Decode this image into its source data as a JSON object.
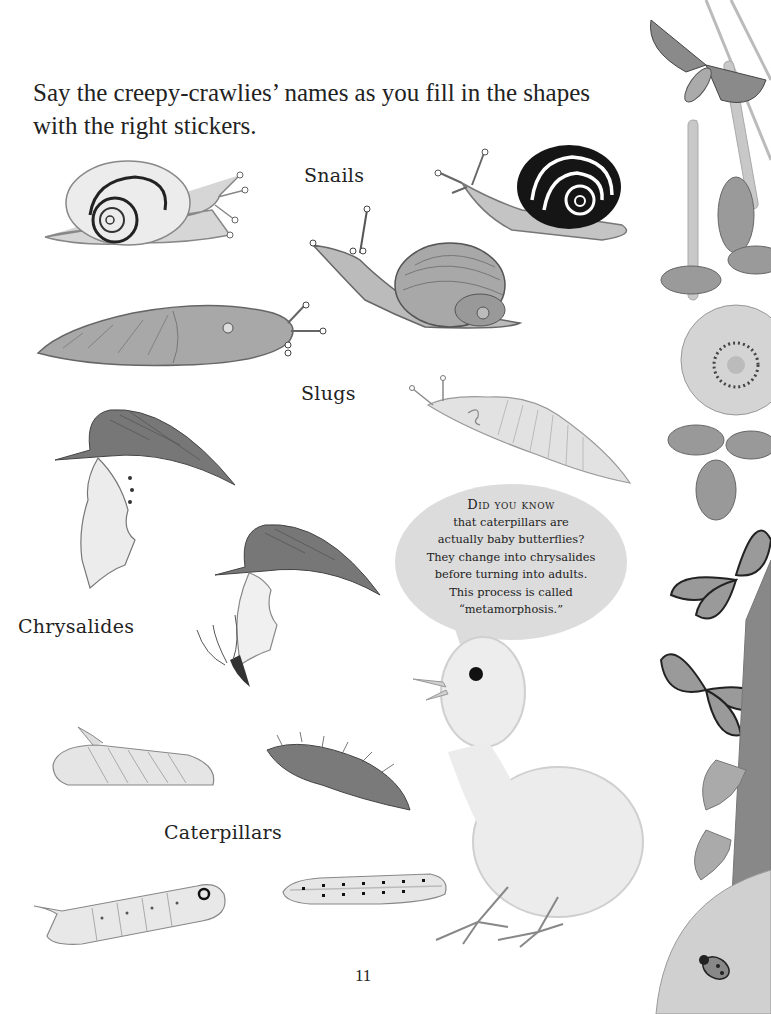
{
  "page": {
    "instructions": "Say the creepy-crawlies’ names as you fill in the shapes with the right stickers.",
    "page_number": "11"
  },
  "sections": [
    {
      "label": "Snails",
      "items": [
        "white-lipped-snail",
        "banded-snail",
        "garden-snail"
      ]
    },
    {
      "label": "Slugs",
      "items": [
        "leopard-slug",
        "pale-slug"
      ]
    },
    {
      "label": "Chrysalides",
      "items": [
        "chrysalis-hanging",
        "butterfly-emerging-chrysalis"
      ]
    },
    {
      "label": "Caterpillars",
      "items": [
        "hawkmoth-caterpillar",
        "hairy-caterpillar",
        "green-caterpillar",
        "spotted-caterpillar"
      ]
    }
  ],
  "did_you_know": {
    "heading": "Did you know",
    "lines": [
      "that caterpillars are",
      "actually baby butterflies?",
      "They change into chrysalides",
      "before turning into adults.",
      "This process is called",
      "“metamorphosis.”"
    ]
  },
  "decorations": {
    "border": [
      "moth",
      "catkins",
      "wild-rose",
      "leaves",
      "butterfly",
      "butterfly",
      "bellflowers",
      "ladybug"
    ],
    "chick": "baby-chick"
  },
  "colors": {
    "background": "#ffffff",
    "text": "#222222",
    "bubble": "#dcdcdc",
    "illustration_gray": "#9a9a9a"
  }
}
